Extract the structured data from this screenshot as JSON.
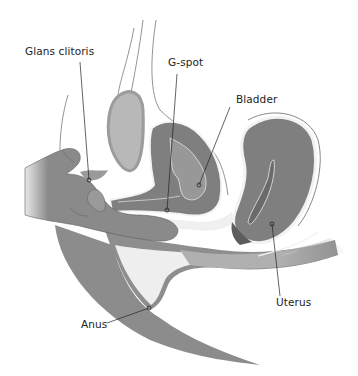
{
  "diagram": {
    "type": "anatomical-cross-section",
    "colors": {
      "background": "#ffffff",
      "tissue_dark": "#7d7d7d",
      "tissue_mid": "#9a9a9a",
      "tissue_light": "#bdbdbd",
      "cavity": "#f1f1f1",
      "outline": "#555555",
      "label_text": "#222222",
      "leader_line": "#222222"
    },
    "labels": [
      {
        "id": "glans-clitoris",
        "text": "Glans clitoris",
        "x": 25,
        "y": 45,
        "line": [
          80,
          62,
          89,
          180
        ]
      },
      {
        "id": "g-spot",
        "text": "G-spot",
        "x": 168,
        "y": 56,
        "line": [
          177,
          74,
          167,
          210
        ]
      },
      {
        "id": "bladder",
        "text": "Bladder",
        "x": 236,
        "y": 93,
        "line": [
          230,
          107,
          199,
          185
        ]
      },
      {
        "id": "uterus",
        "text": "Uterus",
        "x": 276,
        "y": 296,
        "line": [
          280,
          296,
          272,
          224
        ]
      },
      {
        "id": "anus",
        "text": "Anus",
        "x": 81,
        "y": 318,
        "line": [
          107,
          323,
          149,
          308
        ]
      }
    ]
  }
}
